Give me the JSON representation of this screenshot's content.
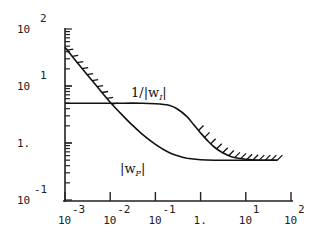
{
  "chart_data": {
    "type": "line",
    "title": "",
    "xlabel": "",
    "ylabel": "",
    "xscale": "log",
    "yscale": "log",
    "xlim": [
      0.001,
      100
    ],
    "ylim": [
      0.1,
      100
    ],
    "grid": false,
    "x_ticks": [
      {
        "base": "10",
        "exp": "-3",
        "value": 0.001
      },
      {
        "base": "10",
        "exp": "-2",
        "value": 0.01
      },
      {
        "base": "10",
        "exp": "-1",
        "value": 0.1
      },
      {
        "base": "1.",
        "exp": "",
        "value": 1
      },
      {
        "base": "10",
        "exp": "1",
        "value": 10
      },
      {
        "base": "10",
        "exp": "2",
        "value": 100
      }
    ],
    "y_ticks": [
      {
        "base": "10",
        "exp": "2",
        "value": 100
      },
      {
        "base": "10",
        "exp": "1",
        "value": 10
      },
      {
        "base": "1.",
        "exp": "",
        "value": 1
      },
      {
        "base": "10",
        "exp": "-1",
        "value": 0.1
      }
    ],
    "series": [
      {
        "name": "|w_P|",
        "label_main": "|w",
        "label_sub": "P",
        "label_close": "|",
        "hatched": true,
        "x": [
          0.001,
          0.002,
          0.005,
          0.01,
          0.02,
          0.03,
          0.05,
          0.1,
          0.2,
          0.3,
          0.5,
          1,
          2,
          5,
          10,
          20,
          50
        ],
        "values": [
          48,
          24,
          10,
          5.2,
          2.9,
          2.1,
          1.45,
          0.95,
          0.68,
          0.6,
          0.54,
          0.51,
          0.5,
          0.5,
          0.5,
          0.5,
          0.5
        ]
      },
      {
        "name": "1/|w_I|",
        "label_main": "1/|w",
        "label_sub": "I",
        "label_close": "|",
        "hatched": true,
        "x": [
          0.001,
          0.01,
          0.05,
          0.1,
          0.2,
          0.3,
          0.5,
          0.7,
          1,
          1.5,
          2,
          3,
          5,
          10,
          20,
          50
        ],
        "values": [
          5,
          5,
          5,
          4.9,
          4.6,
          4.0,
          2.9,
          2.1,
          1.5,
          1.05,
          0.85,
          0.68,
          0.57,
          0.52,
          0.5,
          0.5
        ]
      }
    ]
  }
}
